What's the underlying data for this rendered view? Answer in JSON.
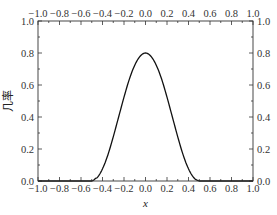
{
  "chart_data": {
    "type": "line",
    "title": "",
    "xlabel": "x",
    "ylabel": "几率",
    "xlim": [
      -1.0,
      1.0
    ],
    "ylim": [
      0.0,
      1.0
    ],
    "grid": false,
    "legend": null,
    "x_ticks": [
      "-1.0",
      "-0.8",
      "-0.6",
      "-0.4",
      "-0.2",
      "0.0",
      "0.2",
      "0.4",
      "0.6",
      "0.8",
      "1.0"
    ],
    "x_ticks_top": [
      "-1.0",
      "-0.8",
      "-0.6",
      "-0.4",
      "-0.2",
      "0.0",
      "0.2",
      "0.4",
      "0.6",
      "0.8",
      "1.0"
    ],
    "y_ticks": [
      "0.0",
      "0.2",
      "0.4",
      "0.6",
      "0.8",
      "1.0"
    ],
    "y_ticks_right": [
      "0.0",
      "0.2",
      "0.4",
      "0.6",
      "0.8",
      "1.0"
    ],
    "series": [
      {
        "name": "probability",
        "color": "#111111",
        "x": [
          -1.0,
          -0.5,
          -0.45,
          -0.4,
          -0.35,
          -0.3,
          -0.25,
          -0.2,
          -0.15,
          -0.1,
          -0.05,
          0.0,
          0.05,
          0.1,
          0.15,
          0.2,
          0.25,
          0.3,
          0.35,
          0.4,
          0.45,
          0.5,
          1.0
        ],
        "y": [
          0.0,
          0.0,
          0.02,
          0.076,
          0.163,
          0.276,
          0.4,
          0.524,
          0.637,
          0.724,
          0.78,
          0.8,
          0.78,
          0.724,
          0.637,
          0.524,
          0.4,
          0.276,
          0.163,
          0.076,
          0.02,
          0.0,
          0.0
        ]
      }
    ]
  }
}
